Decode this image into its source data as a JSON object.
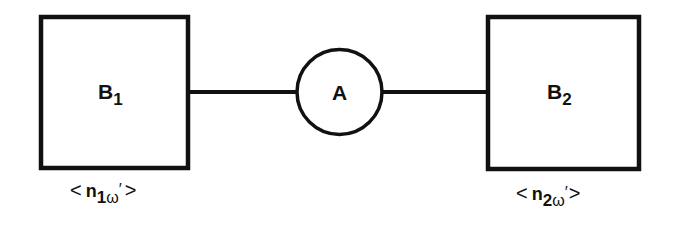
{
  "diagram": {
    "type": "block-diagram",
    "nodes": [
      {
        "id": "B1",
        "shape": "square",
        "label": "B",
        "label_subscript": "1",
        "caption": {
          "open": "<",
          "symbol": "n",
          "subscript_index": "1",
          "subscript_omega": "ω",
          "prime": "′",
          "close": ">"
        }
      },
      {
        "id": "A",
        "shape": "circle",
        "label": "A"
      },
      {
        "id": "B2",
        "shape": "square",
        "label": "B",
        "label_subscript": "2",
        "caption": {
          "open": "<",
          "symbol": "n",
          "subscript_index": "2",
          "subscript_omega": "ω",
          "prime": "′",
          "close": ">"
        }
      }
    ],
    "edges": [
      {
        "from": "B1",
        "to": "A"
      },
      {
        "from": "A",
        "to": "B2"
      }
    ],
    "colors": {
      "stroke": "#111111",
      "background": "#ffffff"
    }
  }
}
